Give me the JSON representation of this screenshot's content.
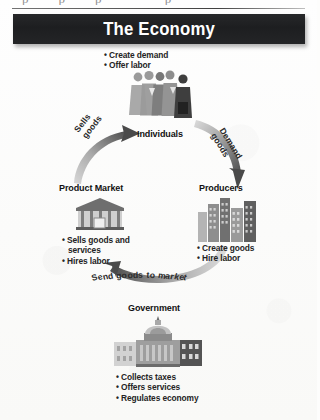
{
  "page": {
    "above_text": "ppp p"
  },
  "banner": {
    "title": "The Economy"
  },
  "nodes": {
    "individuals": {
      "label": "Individuals",
      "icon": "people-group-icon",
      "bullets": [
        "Create demand",
        "Offer labor"
      ]
    },
    "producers": {
      "label": "Producers",
      "icon": "factory-buildings-icon",
      "bullets": [
        "Create goods",
        "Hire labor"
      ]
    },
    "product_market": {
      "label": "Product Market",
      "icon": "storefront-icon",
      "bullets": [
        "Sells goods and",
        "services",
        "Hires labor"
      ]
    },
    "government": {
      "label": "Government",
      "icon": "capitol-building-icon",
      "bullets": [
        "Collects taxes",
        "Offers services",
        "Regulates economy"
      ]
    }
  },
  "arrows": [
    {
      "name": "sells-goods-arrow",
      "label_line1": "Sells",
      "label_line2": "goods",
      "from": "product-market",
      "to": "individuals"
    },
    {
      "name": "demand-goods-arrow",
      "label_line1": "Demand",
      "label_line2": "goods",
      "from": "individuals",
      "to": "producers"
    },
    {
      "name": "send-goods-to-market-arrow",
      "label": "Send goods to market",
      "from": "producers",
      "to": "product-market"
    }
  ],
  "colors": {
    "banner_background": "#1d1e20",
    "banner_text": "#ffffff",
    "page_background": "#fdfdfc",
    "arrow_gray": "#8a8a8a",
    "text": "#1a1a1a"
  }
}
